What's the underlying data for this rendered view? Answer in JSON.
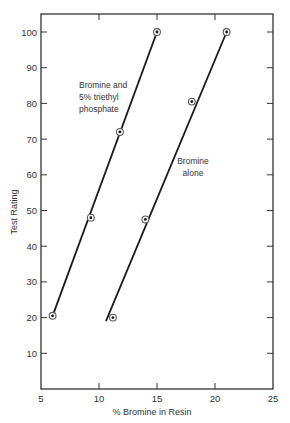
{
  "chart_data": {
    "type": "line",
    "title": "",
    "xlabel": "% Bromine in Resin",
    "ylabel": "Test Rating",
    "xlim": [
      5,
      25
    ],
    "ylim": [
      0,
      105
    ],
    "x_ticks": [
      5,
      10,
      15,
      20,
      25
    ],
    "y_ticks": [
      10,
      20,
      30,
      40,
      50,
      60,
      70,
      80,
      90,
      100
    ],
    "grid": false,
    "legend": "none (inline annotations)",
    "series": [
      {
        "name": "Bromine and 5% triethyl phosphate",
        "label_lines": [
          "Bromine and",
          "5% triethyl",
          "phosphate"
        ],
        "points": [
          [
            6.0,
            20.5
          ],
          [
            9.3,
            48
          ],
          [
            11.8,
            72
          ],
          [
            15.0,
            100
          ]
        ],
        "fit_line": [
          [
            6.0,
            20.5
          ],
          [
            15.0,
            100
          ]
        ]
      },
      {
        "name": "Bromine alone",
        "label_lines": [
          "Bromine",
          "alone"
        ],
        "points": [
          [
            11.2,
            20
          ],
          [
            14.0,
            47.5
          ],
          [
            18.0,
            80.5
          ],
          [
            21.0,
            100
          ]
        ],
        "fit_line": [
          [
            10.6,
            19
          ],
          [
            21.0,
            100
          ]
        ]
      }
    ]
  },
  "colors": {
    "line": "#1a1a1a",
    "frame": "#333333",
    "background": "#ffffff"
  }
}
